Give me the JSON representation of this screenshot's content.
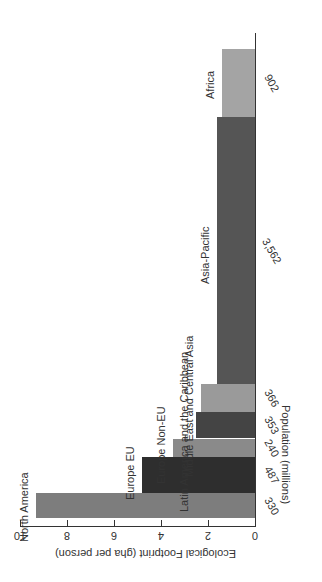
{
  "chart_data": {
    "type": "bar",
    "variant": "variable-width (Marimekko-style) bar chart, image rotated 90 degrees clockwise",
    "title": "",
    "xlabel": "Population (millions)",
    "ylabel": "Ecological Footprint (gha per person)",
    "ylim": [
      0,
      10
    ],
    "yticks": [
      0,
      2,
      4,
      6,
      8,
      10
    ],
    "grid": false,
    "legend": null,
    "categories": [
      "North America",
      "Europe EU",
      "Europe Non-EU",
      "Latin America and the Caribbean",
      "Middle East and Central Asia",
      "Asia-Pacific",
      "Africa"
    ],
    "population_millions": [
      330,
      487,
      240,
      353,
      366,
      3562,
      902
    ],
    "population_labels": [
      "330",
      "487",
      "240",
      "353",
      "366",
      "3,562",
      "902"
    ],
    "values": [
      9.3,
      4.8,
      3.5,
      2.5,
      2.3,
      1.6,
      1.4
    ],
    "colors": [
      "#7d7d7d",
      "#2e2e2e",
      "#8a8a8a",
      "#444444",
      "#9a9a9a",
      "#555555",
      "#a4a4a4"
    ]
  }
}
